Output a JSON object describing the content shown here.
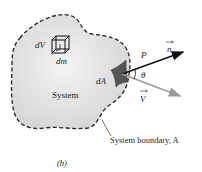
{
  "diagram": {
    "figure_label": "(b)",
    "labels": {
      "volume_element": "dV",
      "mass_element": "dm",
      "area_element": "dA",
      "system": "System",
      "pressure": "P",
      "normal_vector": "n",
      "velocity_vector": "V",
      "angle": "θ",
      "boundary": "System boundary, A"
    },
    "colors": {
      "system_fill": "#e2e2e2",
      "boundary_stroke": "#222222",
      "area_patch": "#555555",
      "normal_arrow": "#111111",
      "velocity_arrow": "#9a9a9a"
    }
  }
}
